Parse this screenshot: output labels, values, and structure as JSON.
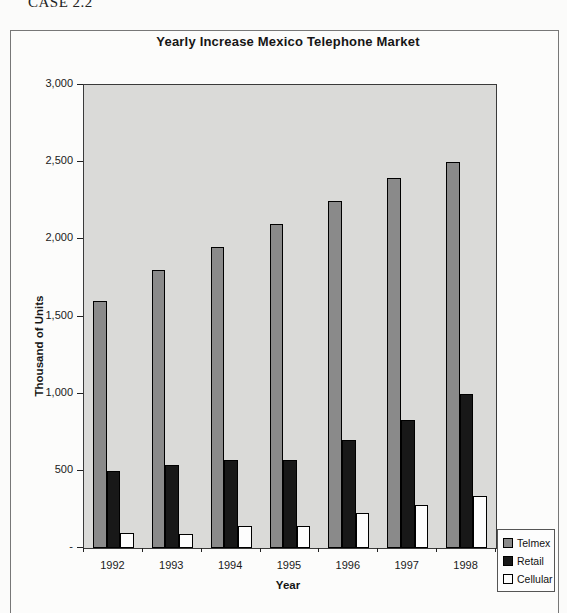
{
  "case_label": "CASE 2.2",
  "chart_data": {
    "type": "bar",
    "title": "Yearly Increase Mexico Telephone Market",
    "xlabel": "Year",
    "ylabel": "Thousand of Units",
    "categories": [
      "1992",
      "1993",
      "1994",
      "1995",
      "1996",
      "1997",
      "1998"
    ],
    "series": [
      {
        "name": "Telmex",
        "color": "#8a8a8a",
        "values": [
          1600,
          1800,
          1950,
          2100,
          2250,
          2400,
          2500
        ]
      },
      {
        "name": "Retail",
        "color": "#181818",
        "values": [
          500,
          540,
          570,
          570,
          700,
          830,
          1000
        ]
      },
      {
        "name": "Cellular",
        "color": "#fdfdfd",
        "values": [
          100,
          90,
          145,
          140,
          230,
          280,
          335
        ]
      }
    ],
    "ylim": [
      0,
      3000
    ],
    "ytick_step": 500,
    "ytick_labels": [
      "-",
      "500",
      "1,000",
      "1,500",
      "2,000",
      "2,500",
      "3,000"
    ],
    "grid": false,
    "legend_position": "bottom-right",
    "plot_bg": "#dadad8"
  }
}
